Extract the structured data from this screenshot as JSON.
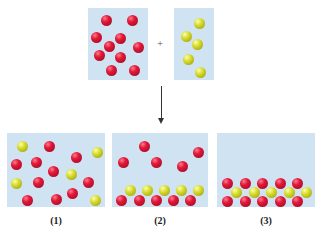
{
  "colors": {
    "box": "#cfe3f2",
    "red_atom": "#d81838",
    "yellow_atom": "#cdd025",
    "arrow": "#333333"
  },
  "reactants": {
    "box_a": {
      "x": 88,
      "y": 8,
      "w": 60,
      "h": 72,
      "atom_type": "red",
      "atoms": [
        [
          106,
          20
        ],
        [
          132,
          20
        ],
        [
          96,
          37
        ],
        [
          120,
          38
        ],
        [
          109,
          46
        ],
        [
          138,
          47
        ],
        [
          99,
          55
        ],
        [
          120,
          57
        ],
        [
          111,
          70
        ],
        [
          134,
          70
        ]
      ]
    },
    "plus": "+",
    "box_b": {
      "x": 174,
      "y": 8,
      "w": 40,
      "h": 72,
      "atom_type": "yellow",
      "atoms": [
        [
          199,
          23
        ],
        [
          186,
          36
        ],
        [
          197,
          44
        ],
        [
          188,
          59
        ],
        [
          200,
          72
        ]
      ]
    }
  },
  "arrow": {
    "x": 161,
    "y1": 86,
    "y2": 124
  },
  "products": [
    {
      "label": "(1)",
      "x": 7,
      "y": 133,
      "w": 98,
      "h": 74,
      "atoms": [
        {
          "t": "yellow",
          "c": [
            22,
            146
          ]
        },
        {
          "t": "red",
          "c": [
            49,
            146
          ]
        },
        {
          "t": "red",
          "c": [
            76,
            157
          ]
        },
        {
          "t": "yellow",
          "c": [
            97,
            152
          ]
        },
        {
          "t": "red",
          "c": [
            16,
            164
          ]
        },
        {
          "t": "red",
          "c": [
            36,
            162
          ]
        },
        {
          "t": "red",
          "c": [
            53,
            171
          ]
        },
        {
          "t": "yellow",
          "c": [
            71,
            174
          ]
        },
        {
          "t": "yellow",
          "c": [
            16,
            183
          ]
        },
        {
          "t": "red",
          "c": [
            38,
            182
          ]
        },
        {
          "t": "red",
          "c": [
            88,
            182
          ]
        },
        {
          "t": "red",
          "c": [
            27,
            200
          ]
        },
        {
          "t": "red",
          "c": [
            56,
            199
          ]
        },
        {
          "t": "red",
          "c": [
            72,
            193
          ]
        },
        {
          "t": "yellow",
          "c": [
            95,
            200
          ]
        }
      ]
    },
    {
      "label": "(2)",
      "x": 112,
      "y": 133,
      "w": 96,
      "h": 74,
      "atoms": [
        {
          "t": "red",
          "c": [
            144,
            146
          ]
        },
        {
          "t": "red",
          "c": [
            198,
            152
          ]
        },
        {
          "t": "red",
          "c": [
            123,
            162
          ]
        },
        {
          "t": "red",
          "c": [
            156,
            162
          ]
        },
        {
          "t": "red",
          "c": [
            182,
            166
          ]
        },
        {
          "t": "yellow",
          "c": [
            130,
            190
          ]
        },
        {
          "t": "yellow",
          "c": [
            147,
            190
          ]
        },
        {
          "t": "yellow",
          "c": [
            164,
            190
          ]
        },
        {
          "t": "yellow",
          "c": [
            181,
            190
          ]
        },
        {
          "t": "yellow",
          "c": [
            198,
            190
          ]
        },
        {
          "t": "red",
          "c": [
            121,
            200
          ]
        },
        {
          "t": "red",
          "c": [
            139,
            200
          ]
        },
        {
          "t": "red",
          "c": [
            156,
            200
          ]
        },
        {
          "t": "red",
          "c": [
            173,
            200
          ]
        },
        {
          "t": "red",
          "c": [
            190,
            200
          ]
        }
      ]
    },
    {
      "label": "(3)",
      "x": 217,
      "y": 133,
      "w": 98,
      "h": 74,
      "atoms": [
        {
          "t": "yellow",
          "c": [
            236,
            192
          ]
        },
        {
          "t": "yellow",
          "c": [
            254,
            192
          ]
        },
        {
          "t": "yellow",
          "c": [
            271,
            192
          ]
        },
        {
          "t": "yellow",
          "c": [
            289,
            192
          ]
        },
        {
          "t": "yellow",
          "c": [
            306,
            192
          ]
        },
        {
          "t": "red",
          "c": [
            227,
            183
          ]
        },
        {
          "t": "red",
          "c": [
            245,
            183
          ]
        },
        {
          "t": "red",
          "c": [
            262,
            183
          ]
        },
        {
          "t": "red",
          "c": [
            280,
            183
          ]
        },
        {
          "t": "red",
          "c": [
            297,
            183
          ]
        },
        {
          "t": "red",
          "c": [
            227,
            201
          ]
        },
        {
          "t": "red",
          "c": [
            245,
            201
          ]
        },
        {
          "t": "red",
          "c": [
            262,
            201
          ]
        },
        {
          "t": "red",
          "c": [
            280,
            201
          ]
        },
        {
          "t": "red",
          "c": [
            297,
            201
          ]
        }
      ]
    }
  ]
}
